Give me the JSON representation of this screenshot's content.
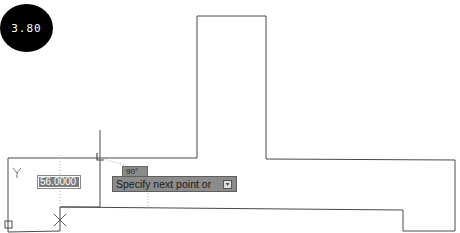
{
  "badge": {
    "label": "3.80"
  },
  "dynamic_input": {
    "value": "56.0000"
  },
  "tooltip": {
    "angle": "90°",
    "prompt": "Specify next point or",
    "options_icon": "down-arrow-icon"
  },
  "ucs": {
    "y_label": "Y"
  },
  "colors": {
    "line": "#4a4a4a",
    "tracking": "#aaaaaa",
    "tooltip_bg": "#8c8c8c",
    "badge_bg": "#000000"
  }
}
